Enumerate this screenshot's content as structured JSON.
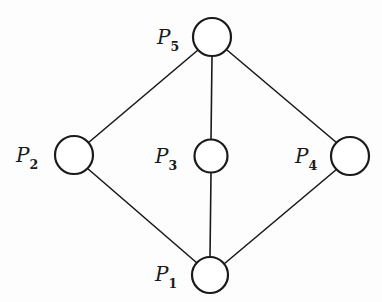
{
  "figure": {
    "kind": "undirected-graph-diagram",
    "background_color": "#fdfdfd",
    "stroke_color": "#1a1a1a",
    "node_fill_color": "#ffffff",
    "edge_stroke_width": 1.6,
    "node_stroke_width": 2.2,
    "width": 382,
    "height": 302
  },
  "nodes": [
    {
      "id": "P5",
      "label_text": "P",
      "label_sub": "5",
      "cx": 212,
      "cy": 37,
      "r": 19,
      "label_x": 157,
      "label_y": 27
    },
    {
      "id": "P2",
      "label_text": "P",
      "label_sub": "2",
      "cx": 74,
      "cy": 155,
      "r": 19,
      "label_x": 16,
      "label_y": 145
    },
    {
      "id": "P3",
      "label_text": "P",
      "label_sub": "3",
      "cx": 211,
      "cy": 156,
      "r": 16.5,
      "label_x": 155,
      "label_y": 146
    },
    {
      "id": "P4",
      "label_text": "P",
      "label_sub": "4",
      "cx": 350,
      "cy": 156,
      "r": 19,
      "label_x": 295,
      "label_y": 146
    },
    {
      "id": "P1",
      "label_text": "P",
      "label_sub": "1",
      "cx": 210,
      "cy": 275,
      "r": 18,
      "label_x": 155,
      "label_y": 264
    }
  ],
  "edges": [
    {
      "from": "P5",
      "to": "P2",
      "x1": 198,
      "y1": 50,
      "x2": 88,
      "y2": 143
    },
    {
      "from": "P5",
      "to": "P4",
      "x1": 227,
      "y1": 50,
      "x2": 337,
      "y2": 143
    },
    {
      "from": "P5",
      "to": "P3",
      "x1": 212,
      "y1": 56,
      "x2": 211,
      "y2": 140
    },
    {
      "from": "P3",
      "to": "P1",
      "x1": 211,
      "y1": 173,
      "x2": 210,
      "y2": 257
    },
    {
      "from": "P2",
      "to": "P1",
      "x1": 87,
      "y1": 168,
      "x2": 197,
      "y2": 263
    },
    {
      "from": "P4",
      "to": "P1",
      "x1": 337,
      "y1": 169,
      "x2": 224,
      "y2": 264
    }
  ]
}
